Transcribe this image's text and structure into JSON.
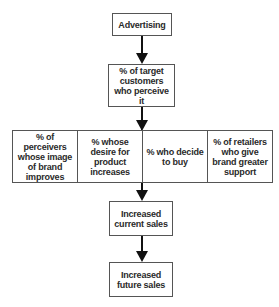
{
  "diagram": {
    "type": "flowchart",
    "nodes": {
      "advertising": "Advertising",
      "perceive": "% of target customers who perceive it",
      "row": [
        "% of perceivers whose image of brand improves",
        "% whose desire for product increases",
        "% who decide to buy",
        "% of retailers who give brand greater support"
      ],
      "current_sales": "Increased current sales",
      "future_sales": "Increased future sales"
    },
    "edges": [
      [
        "advertising",
        "perceive"
      ],
      [
        "perceive",
        "row"
      ],
      [
        "row",
        "current_sales"
      ],
      [
        "current_sales",
        "future_sales"
      ]
    ]
  }
}
